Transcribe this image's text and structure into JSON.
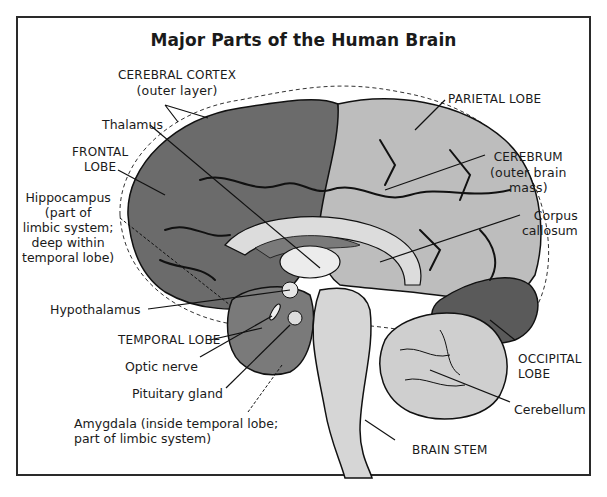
{
  "title": "Major Parts of the Human Brain",
  "colors": {
    "frontal_lobe": "#6b6b6b",
    "parietal_lobe": "#bdbdbd",
    "temporal_lobe": "#7a7a7a",
    "occipital_lobe": "#5a5a5a",
    "cerebellum": "#cfcfcf",
    "brain_stem": "#d6d6d6",
    "corpus_callosum": "#dcdcdc",
    "outline": "#111111",
    "frame": "#2a2a2a"
  },
  "labels": {
    "cerebral_cortex": {
      "line1": "CEREBRAL CORTEX",
      "line2": "(outer layer)"
    },
    "parietal_lobe": "PARIETAL LOBE",
    "thalamus": "Thalamus",
    "frontal_lobe": {
      "line1": "FRONTAL",
      "line2": "LOBE"
    },
    "cerebrum": {
      "line1": "CEREBRUM",
      "line2": "(outer brain",
      "line3": "mass)"
    },
    "hippocampus": {
      "line1": "Hippocampus",
      "line2": "(part of",
      "line3": "limbic system;",
      "line4": "deep within",
      "line5": "temporal lobe)"
    },
    "corpus_callosum": {
      "line1": "Corpus",
      "line2": "callosum"
    },
    "hypothalamus": "Hypothalamus",
    "temporal_lobe": "TEMPORAL LOBE",
    "optic_nerve": "Optic nerve",
    "pituitary_gland": "Pituitary gland",
    "occipital_lobe": {
      "line1": "OCCIPITAL",
      "line2": "LOBE"
    },
    "amygdala": {
      "line1": "Amygdala (inside temporal lobe;",
      "line2": "part of limbic system)"
    },
    "cerebellum": "Cerebellum",
    "brain_stem": "BRAIN STEM"
  }
}
